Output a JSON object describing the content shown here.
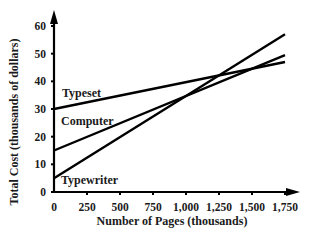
{
  "chart_data": {
    "type": "line",
    "title": "",
    "xlabel": "Number of Pages (thousands)",
    "ylabel": "Total Cost (thousands of dollars)",
    "xlim": [
      0,
      1750
    ],
    "ylim": [
      0,
      60
    ],
    "xticks": [
      0,
      250,
      500,
      750,
      1000,
      1250,
      1500,
      1750
    ],
    "xtick_labels": [
      "0",
      "250",
      "500",
      "750",
      "1,000",
      "1,250",
      "1,500",
      "1,750"
    ],
    "yticks": [
      0,
      10,
      20,
      30,
      40,
      50,
      60
    ],
    "ytick_labels": [
      "0",
      "10",
      "20",
      "30",
      "40",
      "50",
      "60"
    ],
    "grid": false,
    "legend": "inline labels",
    "series": [
      {
        "name": "Typeset",
        "x": [
          0,
          1750
        ],
        "values": [
          30,
          47
        ]
      },
      {
        "name": "Computer",
        "x": [
          0,
          1750
        ],
        "values": [
          15,
          49.5
        ]
      },
      {
        "name": "Typewriter",
        "x": [
          0,
          1750
        ],
        "values": [
          5,
          57
        ]
      }
    ]
  }
}
